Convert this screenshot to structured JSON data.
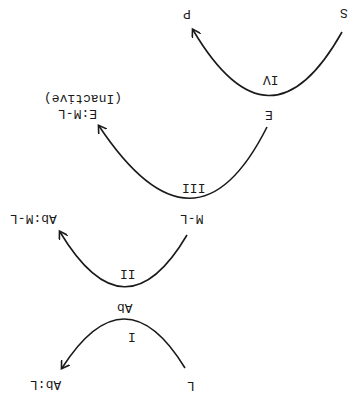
{
  "orientation": "rotated 180 degrees",
  "diagram": {
    "steps": [
      {
        "roman": "I",
        "from": "L",
        "to": "Ab:L"
      },
      {
        "roman": "II",
        "from": "Ab",
        "to": "Ab:M-L"
      },
      {
        "roman": "III",
        "from": "M-L",
        "to": "E:M-L",
        "to_note": "(Inactive)"
      },
      {
        "roman": "IV",
        "from": "E",
        "extra": "S",
        "to": "P"
      }
    ],
    "labels": {
      "S": "S",
      "P": "P",
      "IV": "IV",
      "E": "E",
      "EML": "E:M-L",
      "inactive": "(Inactive)",
      "III": "III",
      "ML": "M-L",
      "AbML": "Ab:M-L",
      "II": "II",
      "Ab": "Ab",
      "I": "I",
      "L": "L",
      "AbL": "Ab:L"
    },
    "colors": {
      "ink": "#1a1a1a",
      "background": "#ffffff"
    }
  }
}
